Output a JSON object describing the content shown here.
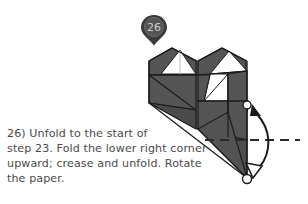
{
  "page": {
    "width": 308,
    "height": 204,
    "background": "#ffffff"
  },
  "step_marker": {
    "icon": "map-pin-icon",
    "number": "26",
    "pin_fill": "#3b3b3b",
    "pin_inner_fill": "#555555",
    "number_color": "#cfcfcf"
  },
  "instruction": {
    "text": "26) Unfold to the start of\nstep 23. Fold the lower right corner\nupward; crease and unfold. Rotate\nthe paper.",
    "color": "#4a4a4a"
  },
  "diagram": {
    "name": "origami-model-figure",
    "paper_fill": "#555555",
    "paper_fill_dark": "#474747",
    "paper_fill_light": "#606060",
    "pocket_fill": "#ffffff",
    "outline_color": "#1a1a1a",
    "crease_line_color": "#2b2b2b",
    "crease_style": "dashed",
    "arrow": {
      "name": "rotate-fold-arrow",
      "color": "#1a1a1a",
      "head_top": "filled",
      "head_bottom": "hollow",
      "endpoint_marker": "circle"
    }
  }
}
